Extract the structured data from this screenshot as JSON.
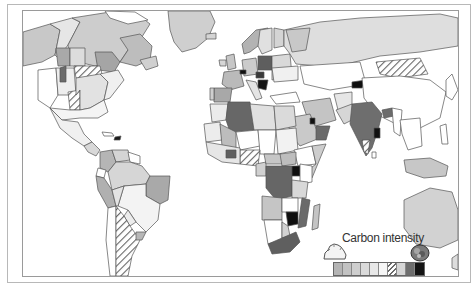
{
  "map": {
    "title": "Carbon intensity",
    "type": "choropleth world map",
    "colors": {
      "ocean": "#ffffff",
      "border": "#555555",
      "frame_outer": "#b8b8b8",
      "frame_inner": "#9a9a9a"
    }
  },
  "legend": {
    "title": "Carbon intensity",
    "low_icon": "clean-cloud-icon",
    "high_icon": "smoke-cloud-icon",
    "swatches": [
      {
        "fill": "#b4b4b4",
        "pattern": "solid"
      },
      {
        "fill": "#c2c2c2",
        "pattern": "solid"
      },
      {
        "fill": "#cecece",
        "pattern": "solid"
      },
      {
        "fill": "#dadada",
        "pattern": "solid"
      },
      {
        "fill": "#e8e8e8",
        "pattern": "solid"
      },
      {
        "fill": "#f6f6f6",
        "pattern": "solid"
      },
      {
        "fill": "#ffffff",
        "pattern": "hatched"
      },
      {
        "fill": "#d6d6d6",
        "pattern": "solid"
      },
      {
        "fill": "#6e6e6e",
        "pattern": "solid"
      },
      {
        "fill": "#141414",
        "pattern": "solid"
      }
    ]
  }
}
